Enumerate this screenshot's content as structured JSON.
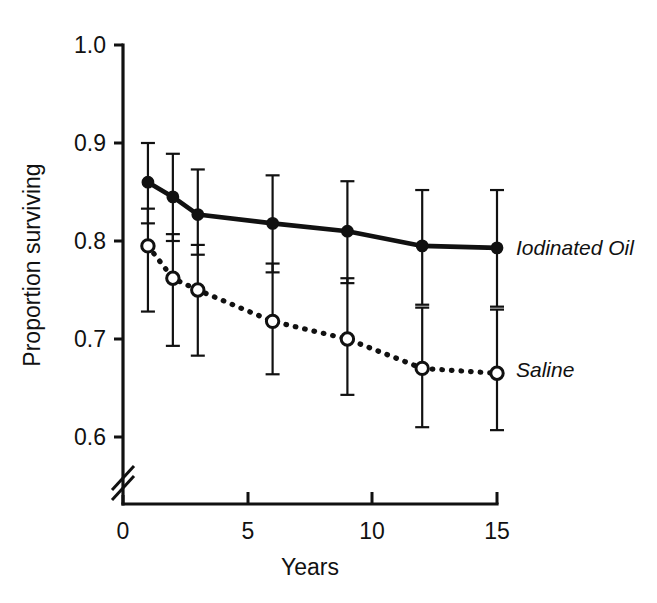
{
  "chart_data": {
    "type": "line",
    "title": "",
    "subtitle": "",
    "xlabel": "Years",
    "ylabel": "Proportion surviving",
    "xlim": [
      0,
      15
    ],
    "ylim": [
      0.6,
      1.0
    ],
    "xticks": [
      0,
      5,
      10,
      15
    ],
    "xtick_labels": [
      "0",
      "5",
      "10",
      "15"
    ],
    "yticks": [
      0.6,
      0.7,
      0.8,
      0.9,
      1.0
    ],
    "ytick_labels": [
      "0.6",
      "0.7",
      "0.8",
      "0.9",
      "1.0"
    ],
    "grid": false,
    "legend_position": "right-inline",
    "y_axis_break": true,
    "x_axis_break": true,
    "x": [
      1,
      2,
      3,
      6,
      9,
      12,
      15
    ],
    "series": [
      {
        "name": "Iodinated Oil",
        "marker": "filled-circle",
        "linestyle": "solid",
        "values": [
          0.86,
          0.845,
          0.827,
          0.818,
          0.81,
          0.795,
          0.793
        ],
        "err_low": [
          0.818,
          0.8,
          0.786,
          0.768,
          0.757,
          0.735,
          0.733
        ],
        "err_high": [
          0.9,
          0.889,
          0.873,
          0.867,
          0.861,
          0.852,
          0.852
        ],
        "label_x": 15.6,
        "label_y": 0.793
      },
      {
        "name": "Saline",
        "marker": "open-circle",
        "linestyle": "dotted",
        "values": [
          0.795,
          0.762,
          0.75,
          0.718,
          0.7,
          0.67,
          0.665
        ],
        "err_low": [
          0.728,
          0.693,
          0.683,
          0.664,
          0.643,
          0.61,
          0.607
        ],
        "err_high": [
          0.833,
          0.807,
          0.796,
          0.777,
          0.762,
          0.732,
          0.73
        ],
        "label_x": 15.6,
        "label_y": 0.668
      }
    ]
  },
  "axes": {
    "y_title": "Proportion surviving",
    "x_title": "Years",
    "ytick_labels": [
      "1.0",
      "0.9",
      "0.8",
      "0.7",
      "0.6"
    ],
    "xtick_labels": [
      "0",
      "5",
      "10",
      "15"
    ]
  },
  "legend": {
    "iodinated_oil": "Iodinated Oil",
    "saline": "Saline"
  },
  "colors": {
    "ink": "#111111",
    "background": "#ffffff"
  }
}
